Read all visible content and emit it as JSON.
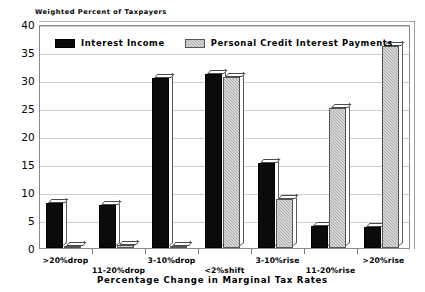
{
  "chart_data": {
    "type": "bar",
    "title": "",
    "ylabel": "Weighted Percent of Taxpayers",
    "xlabel": "Percentage Change in Marginal Tax Rates",
    "categories": [
      ">20%drop",
      "11-20%drop",
      "3-10%drop",
      "<2%shift",
      "3-10%rise",
      "11-20%rise",
      ">20%rise"
    ],
    "series": [
      {
        "name": "Interest Income",
        "color": "#0b0b0b",
        "values": [
          8.0,
          7.7,
          30.3,
          31.0,
          15.2,
          3.9,
          3.8
        ]
      },
      {
        "name": "Personal Credit Interest Payments",
        "color": "#a9a9a9",
        "values": [
          0.4,
          0.6,
          0.3,
          30.6,
          8.7,
          25.0,
          36.0
        ]
      }
    ],
    "ylim": [
      0,
      40
    ],
    "ytick_step": 5,
    "yticks": [
      "40",
      "35",
      "30",
      "25",
      "20",
      "15",
      "10",
      "5",
      "0"
    ],
    "grid": true,
    "legend_position": "inside-top-left"
  },
  "legend": {
    "entries": [
      {
        "label": "Interest Income",
        "swatch": "black-solid"
      },
      {
        "label": "Personal Credit Interest Payments",
        "swatch": "gray-hatched"
      }
    ]
  }
}
